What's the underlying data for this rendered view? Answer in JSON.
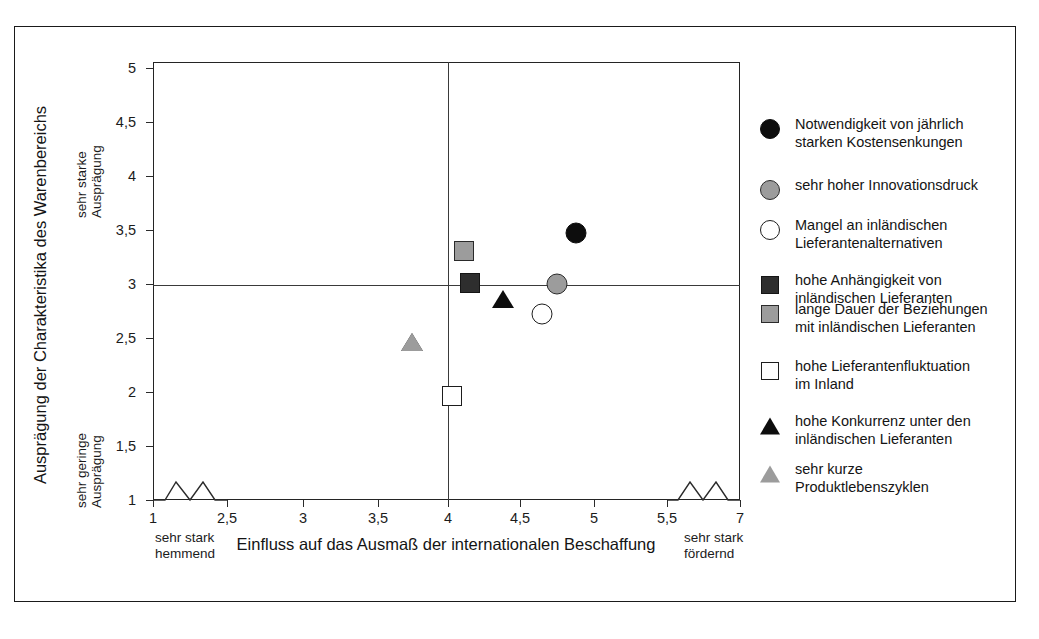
{
  "chart_data": {
    "type": "scatter",
    "title": "",
    "xlabel": "Einfluss auf das Ausmaß der internationalen Beschaffung",
    "ylabel": "Ausprägung der Charakteristika des Warenbereichs",
    "xlim": [
      1,
      7
    ],
    "ylim": [
      1,
      5
    ],
    "grid": false,
    "x_ticks": [
      "1",
      "2,5",
      "3",
      "3,5",
      "4",
      "4,5",
      "5",
      "5,5",
      "7"
    ],
    "x_tick_values": [
      1,
      2.5,
      3,
      3.5,
      4,
      4.5,
      5,
      5.5,
      7
    ],
    "y_ticks": [
      "1",
      "1,5",
      "2",
      "2,5",
      "3",
      "3,5",
      "4",
      "4,5",
      "5"
    ],
    "y_tick_values": [
      1,
      1.5,
      2,
      2.5,
      3,
      3.5,
      4,
      4.5,
      5
    ],
    "x_axis_break": true,
    "y_axis_break": false,
    "reference_lines": {
      "vertical_x": 4,
      "horizontal_y": 3
    },
    "x_axis_low_label": "sehr stark\nhemmend",
    "x_axis_high_label": "sehr stark\nfördernd",
    "y_axis_high_label": "sehr starke\nAusprägung",
    "y_axis_low_label": "sehr geringe\nAusprägung",
    "legend_position": "right",
    "points": [
      {
        "label": "Notwendigkeit von jährlich\nstarken Kostensenkungen",
        "x": 4.88,
        "y": 3.47,
        "marker": "circle",
        "fill": "#0d0d0d",
        "style": "filled-black"
      },
      {
        "label": "sehr hoher Innovationsdruck",
        "x": 4.75,
        "y": 3.0,
        "marker": "circle",
        "fill": "#9c9c9c",
        "style": "filled-grey"
      },
      {
        "label": "Mangel an inländischen\nLieferantenalternativen",
        "x": 4.65,
        "y": 2.72,
        "marker": "circle",
        "fill": "#ffffff",
        "style": "open-white"
      },
      {
        "label": "hohe Anhängigkeit von\ninländischen Lieferanten",
        "x": 4.15,
        "y": 3.01,
        "marker": "square",
        "fill": "#2e2e2e",
        "style": "filled-dark"
      },
      {
        "label": "lange Dauer der Beziehungen\nmit inländischen Lieferanten",
        "x": 4.11,
        "y": 3.31,
        "marker": "square",
        "fill": "#9c9c9c",
        "style": "filled-grey"
      },
      {
        "label": "hohe Lieferantenfluktuation\nim Inland",
        "x": 4.03,
        "y": 1.96,
        "marker": "square",
        "fill": "#ffffff",
        "style": "open-white"
      },
      {
        "label": "hohe Konkurrenz unter den\ninländischen Lieferanten",
        "x": 4.38,
        "y": 2.87,
        "marker": "triangle",
        "fill": "#0d0d0d",
        "style": "filled-black"
      },
      {
        "label": "sehr kurze\nProduktlebenszyklen",
        "x": 3.74,
        "y": 2.47,
        "marker": "triangle",
        "fill": "#9c9c9c",
        "style": "filled-grey"
      }
    ]
  },
  "colors": {
    "black": "#0d0d0d",
    "dark": "#2e2e2e",
    "grey": "#9c9c9c",
    "white": "#ffffff",
    "axis": "#2b2b2b",
    "frame": "#1a1a1a"
  }
}
